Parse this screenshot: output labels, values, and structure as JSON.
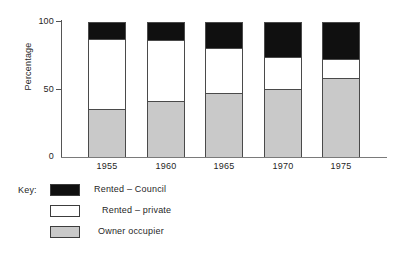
{
  "chart_data": {
    "type": "bar",
    "subtype": "stacked-bar-100",
    "title": "",
    "xlabel": "",
    "ylabel": "Percentage",
    "categories": [
      "1955",
      "1960",
      "1965",
      "1970",
      "1975"
    ],
    "ylim": [
      0,
      100
    ],
    "yticks": [
      0,
      50,
      100
    ],
    "ytick_labels": [
      "0",
      "50",
      "100"
    ],
    "grid": false,
    "legend_position": "below-left",
    "legend_title": "Key:",
    "series": [
      {
        "name": "Owner occupier",
        "color": "#c9c9c9",
        "values": [
          35,
          41,
          47,
          50,
          58
        ]
      },
      {
        "name": "Rented – private",
        "color": "#ffffff",
        "values": [
          53,
          46,
          34,
          25,
          15
        ]
      },
      {
        "name": "Rented – Council",
        "color": "#101010",
        "values": [
          12,
          13,
          19,
          25,
          27
        ]
      }
    ],
    "cumulative_tops": {
      "owner_occupier": [
        35,
        41,
        47,
        50,
        58
      ],
      "plus_rented_private": [
        88,
        87,
        81,
        75,
        73
      ],
      "plus_rented_council": [
        100,
        100,
        100,
        100,
        100
      ]
    }
  },
  "axes": {
    "y_title": "Percentage",
    "y_ticks": [
      {
        "label": "100",
        "value": 100
      },
      {
        "label": "50",
        "value": 50
      },
      {
        "label": "0",
        "value": 0
      }
    ],
    "x_ticks": [
      {
        "label": "1955"
      },
      {
        "label": "1960"
      },
      {
        "label": "1965"
      },
      {
        "label": "1970"
      },
      {
        "label": "1975"
      }
    ]
  },
  "legend": {
    "title": "Key:",
    "items": [
      {
        "label": "Rented – Council",
        "color": "#101010",
        "swatch": "black-swatch"
      },
      {
        "label": "Rented – private",
        "color": "#ffffff",
        "swatch": "white-swatch"
      },
      {
        "label": "Owner occupier",
        "color": "#c9c9c9",
        "swatch": "grey-swatch"
      }
    ]
  }
}
